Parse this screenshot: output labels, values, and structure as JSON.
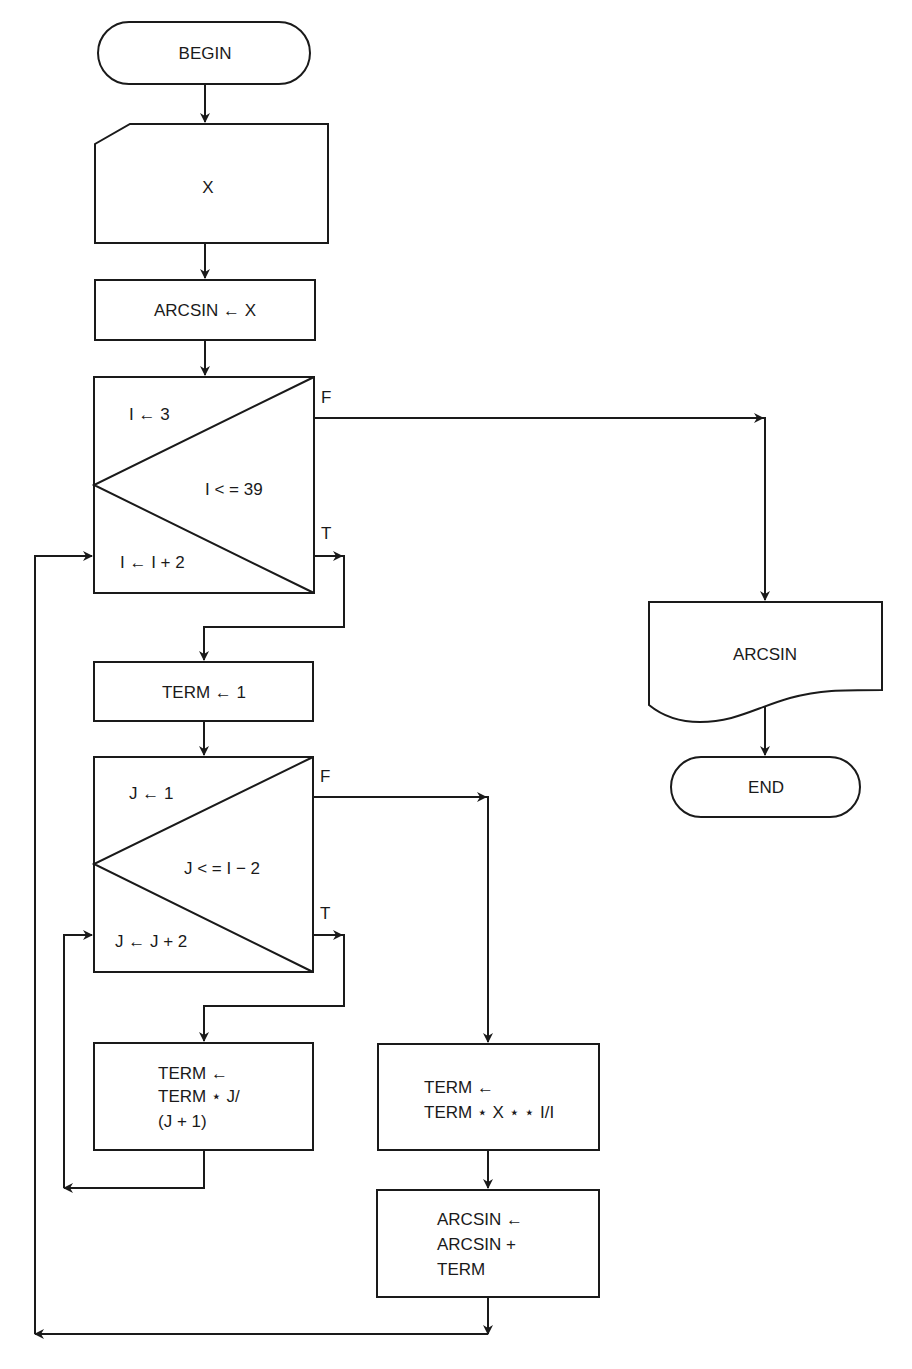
{
  "diagram": {
    "type": "flowchart",
    "colors": {
      "stroke": "#1a1a1a",
      "background": "#ffffff"
    },
    "nodes": {
      "begin": {
        "shape": "terminator",
        "label": "BEGIN"
      },
      "input_x": {
        "shape": "card-input",
        "label": "X"
      },
      "init_arcsin": {
        "shape": "process",
        "label": "ARCSIN ← X"
      },
      "loop_i": {
        "shape": "loop-decision",
        "init": "I ← 3",
        "condition": "I < = 39",
        "increment": "I ← I + 2",
        "false_label": "F",
        "true_label": "T"
      },
      "init_term": {
        "shape": "process",
        "label": "TERM ← 1"
      },
      "loop_j": {
        "shape": "loop-decision",
        "init": "J ← 1",
        "condition": "J < = I − 2",
        "increment": "J ← J + 2",
        "false_label": "F",
        "true_label": "T"
      },
      "term_update_j": {
        "shape": "process",
        "lines": [
          "TERM ←",
          "TERM ⋆ J/",
          "(J + 1)"
        ]
      },
      "term_update_x": {
        "shape": "process",
        "lines": [
          "TERM ←",
          "TERM ⋆ X ⋆ ⋆ I/I"
        ]
      },
      "arcsin_update": {
        "shape": "process",
        "lines": [
          "ARCSIN ←",
          "ARCSIN +",
          "TERM"
        ]
      },
      "output_arcsin": {
        "shape": "document-output",
        "label": "ARCSIN"
      },
      "end": {
        "shape": "terminator",
        "label": "END"
      }
    },
    "edges": [
      {
        "from": "begin",
        "to": "input_x"
      },
      {
        "from": "input_x",
        "to": "init_arcsin"
      },
      {
        "from": "init_arcsin",
        "to": "loop_i"
      },
      {
        "from": "loop_i",
        "to": "output_arcsin",
        "label": "F"
      },
      {
        "from": "loop_i",
        "to": "init_term",
        "label": "T"
      },
      {
        "from": "init_term",
        "to": "loop_j"
      },
      {
        "from": "loop_j",
        "to": "term_update_x",
        "label": "F"
      },
      {
        "from": "loop_j",
        "to": "term_update_j",
        "label": "T"
      },
      {
        "from": "term_update_j",
        "to": "loop_j"
      },
      {
        "from": "term_update_x",
        "to": "arcsin_update"
      },
      {
        "from": "arcsin_update",
        "to": "loop_i"
      },
      {
        "from": "output_arcsin",
        "to": "end"
      }
    ]
  }
}
